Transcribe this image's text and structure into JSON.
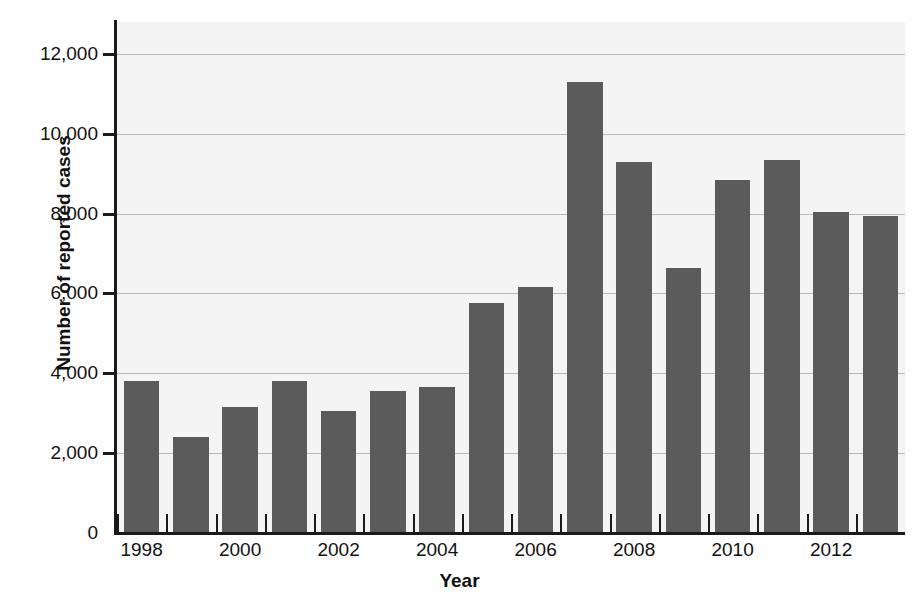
{
  "chart_data": {
    "type": "bar",
    "title": "",
    "xlabel": "Year",
    "ylabel": "Number of reported cases",
    "categories": [
      "1998",
      "1999",
      "2000",
      "2001",
      "2002",
      "2003",
      "2004",
      "2005",
      "2006",
      "2007",
      "2008",
      "2009",
      "2010",
      "2011",
      "2012",
      "2013"
    ],
    "values": [
      3800,
      2400,
      3150,
      3820,
      3050,
      3550,
      3650,
      5750,
      6150,
      11300,
      9300,
      6650,
      8850,
      9350,
      8050,
      7950
    ],
    "ylim": [
      0,
      12800
    ],
    "ytick_values": [
      0,
      2000,
      4000,
      6000,
      8000,
      10000,
      12000
    ],
    "ytick_labels": [
      "0",
      "2,000",
      "4,000",
      "6,000",
      "8,000",
      "10,000",
      "12,000"
    ],
    "xtick_labels": [
      "1998",
      "2000",
      "2002",
      "2004",
      "2006",
      "2008",
      "2010",
      "2012"
    ],
    "xtick_categories": [
      "1998",
      "2000",
      "2002",
      "2004",
      "2006",
      "2008",
      "2010",
      "2012"
    ],
    "grid": "horizontal",
    "legend": "none",
    "bar_color": "#5b5b5b",
    "plot_background": "#f4f4f4",
    "axis_color": "#1a1a1a",
    "gridline_color": "#b9b9b9"
  }
}
